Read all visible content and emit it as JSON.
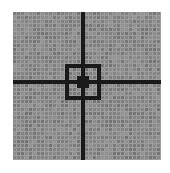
{
  "image": {
    "title": "Crosshair Reticle Target",
    "width": 170,
    "height": 173,
    "background_color": "#ffffff"
  },
  "grid": {
    "origin_x": 13,
    "origin_y": 12,
    "cell_size": 4,
    "cols": 37,
    "rows": 37,
    "cell_color": "#8a8a8a",
    "cell_color_alt": "#7c7c7c",
    "gap_color": "#9d9d9d",
    "gap_size": 1,
    "noise_amplitude": 10
  },
  "reticle": {
    "mark_color": "#1a1a1a",
    "crosshair": {
      "center_col": 17,
      "center_row": 17,
      "vertical_label": "vertical-crosshair-line",
      "horizontal_label": "horizontal-crosshair-line",
      "vertical_thickness_cells": 1,
      "horizontal_thickness_cells": 1,
      "vertical_from_row": 0,
      "vertical_to_row": 36,
      "horizontal_from_col": 0,
      "horizontal_to_col": 36
    },
    "box": {
      "label": "center-box-outline",
      "left_col": 13,
      "top_row": 13,
      "right_col": 21,
      "bottom_row": 21,
      "stroke_cells": 1
    },
    "inner_box": {
      "label": "center-inner-box",
      "left_col": 16,
      "top_row": 16,
      "right_col": 18,
      "bottom_row": 18,
      "stroke_cells": 1
    }
  },
  "chart_data": {
    "type": "heatmap",
    "xlabel": "",
    "ylabel": "",
    "categories": [],
    "values": [],
    "legend": [],
    "grid": true
  },
  "accessibility": {
    "alt_text": "A square gray pixel grid with a dark vertical line and a dark horizontal line crossing at the center, plus a dark square outline around the crossing point, forming a crosshair targeting reticle."
  }
}
